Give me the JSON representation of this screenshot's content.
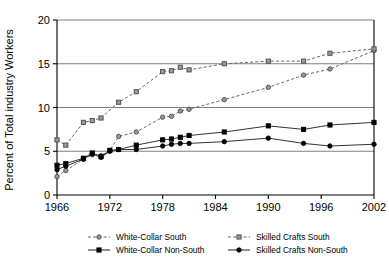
{
  "chart_data": {
    "type": "line",
    "title": "",
    "xlabel": "",
    "ylabel": "Percent of Total industry Workers",
    "xlim": [
      1966,
      2002
    ],
    "ylim": [
      0,
      20
    ],
    "grid": true,
    "gridlines_y": [
      0,
      5,
      10,
      15,
      20
    ],
    "xticks": [
      1966,
      1972,
      1978,
      1984,
      1990,
      1996,
      2002
    ],
    "xticklabels": [
      "1966",
      "1972",
      "1978",
      "1984",
      "1990",
      "1996",
      "2002"
    ],
    "yticks": [
      0,
      5,
      10,
      15,
      20
    ],
    "yticklabels": [
      "0",
      "5",
      "10",
      "15",
      "20"
    ],
    "legend_position": "bottom",
    "series": [
      {
        "name": "White-Collar  South",
        "marker": "circle",
        "marker_fill": "#999999",
        "line_style": "dashed",
        "color": "#666666",
        "points": [
          [
            1966,
            2.1
          ],
          [
            1967,
            2.8
          ],
          [
            1969,
            4.1
          ],
          [
            1970,
            4.6
          ],
          [
            1971,
            4.5
          ],
          [
            1972,
            5.1
          ],
          [
            1973,
            6.7
          ],
          [
            1975,
            7.2
          ],
          [
            1978,
            8.9
          ],
          [
            1979,
            9.0
          ],
          [
            1980,
            9.6
          ],
          [
            1981,
            9.8
          ],
          [
            1985,
            10.9
          ],
          [
            1990,
            12.3
          ],
          [
            1994,
            13.7
          ],
          [
            1997,
            14.4
          ],
          [
            2002,
            16.5
          ]
        ]
      },
      {
        "name": "Skilled Crafts South",
        "marker": "square",
        "marker_fill": "#999999",
        "line_style": "dashed",
        "color": "#666666",
        "points": [
          [
            1966,
            6.3
          ],
          [
            1967,
            5.7
          ],
          [
            1969,
            8.3
          ],
          [
            1970,
            8.5
          ],
          [
            1971,
            8.8
          ],
          [
            1973,
            10.6
          ],
          [
            1975,
            11.8
          ],
          [
            1978,
            14.1
          ],
          [
            1979,
            14.2
          ],
          [
            1980,
            14.6
          ],
          [
            1981,
            14.3
          ],
          [
            1985,
            15.0
          ],
          [
            1990,
            15.3
          ],
          [
            1994,
            15.3
          ],
          [
            1997,
            16.2
          ],
          [
            2002,
            16.7
          ]
        ]
      },
      {
        "name": "White-Collar Non-South",
        "marker": "square",
        "marker_fill": "#000000",
        "line_style": "solid",
        "color": "#333333",
        "points": [
          [
            1966,
            3.4
          ],
          [
            1967,
            3.6
          ],
          [
            1969,
            4.2
          ],
          [
            1970,
            4.8
          ],
          [
            1971,
            4.4
          ],
          [
            1972,
            5.1
          ],
          [
            1973,
            5.2
          ],
          [
            1975,
            5.7
          ],
          [
            1978,
            6.3
          ],
          [
            1979,
            6.4
          ],
          [
            1980,
            6.6
          ],
          [
            1981,
            6.8
          ],
          [
            1985,
            7.2
          ],
          [
            1990,
            7.9
          ],
          [
            1994,
            7.5
          ],
          [
            1997,
            8.0
          ],
          [
            2002,
            8.3
          ]
        ]
      },
      {
        "name": "Skilled Crafts Non-South",
        "marker": "circle",
        "marker_fill": "#000000",
        "line_style": "solid",
        "color": "#333333",
        "points": [
          [
            1966,
            2.9
          ],
          [
            1967,
            3.3
          ],
          [
            1969,
            4.1
          ],
          [
            1970,
            4.7
          ],
          [
            1971,
            4.3
          ],
          [
            1972,
            5.0
          ],
          [
            1973,
            5.2
          ],
          [
            1975,
            5.2
          ],
          [
            1978,
            5.6
          ],
          [
            1979,
            5.8
          ],
          [
            1980,
            5.9
          ],
          [
            1981,
            5.9
          ],
          [
            1985,
            6.1
          ],
          [
            1990,
            6.5
          ],
          [
            1994,
            5.9
          ],
          [
            1997,
            5.6
          ],
          [
            2002,
            5.8
          ]
        ]
      }
    ]
  },
  "legend": {
    "entries": [
      {
        "label": "White-Collar  South",
        "marker": "circle",
        "fill": "#999999",
        "style": "dashed"
      },
      {
        "label": "Skilled Crafts South",
        "marker": "square",
        "fill": "#999999",
        "style": "dashed"
      },
      {
        "label": "White-Collar Non-South",
        "marker": "square",
        "fill": "#000000",
        "style": "solid"
      },
      {
        "label": "Skilled Crafts Non-South",
        "marker": "circle",
        "fill": "#000000",
        "style": "solid"
      }
    ]
  },
  "colors": {
    "axis": "#000000",
    "grid": "#808080",
    "south_series": "#666666",
    "nonsouth_series": "#333333",
    "background": "#ffffff"
  }
}
